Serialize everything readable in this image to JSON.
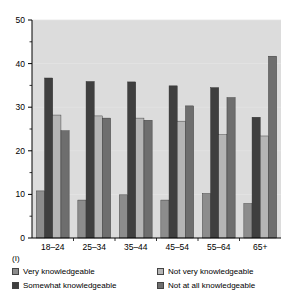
{
  "chart_data": {
    "type": "bar",
    "title": "",
    "subtitle": "",
    "xlabel": "(II)",
    "ylabel": "",
    "categories": [
      "18–24",
      "25–34",
      "35–44",
      "45–54",
      "55–64",
      "65+"
    ],
    "series": [
      {
        "name": "Very knowledgeable",
        "color": "#8c8c8c",
        "values": [
          10.8,
          8.7,
          9.9,
          8.7,
          10.2,
          7.9
        ]
      },
      {
        "name": "Somewhat knowledgeable",
        "color": "#3f3f3f",
        "values": [
          36.7,
          35.9,
          35.8,
          34.9,
          34.5,
          27.7
        ]
      },
      {
        "name": "Not very knowledgeable",
        "color": "#b5b5b5",
        "values": [
          28.2,
          28.0,
          27.5,
          26.8,
          23.7,
          23.4
        ]
      },
      {
        "name": "Not at all knowledgeable",
        "color": "#6e6e6e",
        "values": [
          24.6,
          27.5,
          27.0,
          30.3,
          32.2,
          41.7
        ]
      }
    ],
    "ylim": [
      0,
      50
    ],
    "yticks": [
      0,
      10,
      20,
      30,
      40,
      50
    ],
    "ytick_labels": [
      "0",
      "10",
      "20",
      "30",
      "40",
      "50"
    ],
    "yminor_ticks": [
      5,
      15,
      25,
      35,
      45
    ],
    "grid": true,
    "grid_color": "#e4e4e4",
    "plot_background": "#dcdcdc",
    "legend_position": "below"
  },
  "labels": {
    "panel_left": "(I)",
    "panel_bottom": "(II)"
  },
  "legend": {
    "entries": [
      {
        "label": "Very knowledgeable",
        "color": "#8c8c8c"
      },
      {
        "label": "Not very knowledgeable",
        "color": "#b5b5b5"
      },
      {
        "label": "Somewhat knowledgeable",
        "color": "#3f3f3f"
      },
      {
        "label": "Not at all knowledgeable",
        "color": "#6e6e6e"
      }
    ]
  }
}
